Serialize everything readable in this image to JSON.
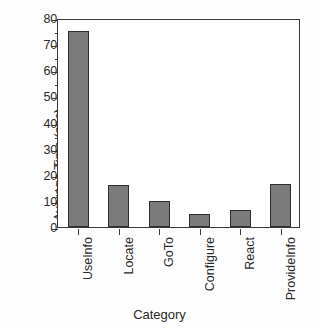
{
  "chart_data": {
    "type": "bar",
    "title": "",
    "xlabel": "Category",
    "ylabel": "Average Time (sec)",
    "categories": [
      "UseInfo",
      "Locate",
      "GoTo",
      "Configure",
      "React",
      "ProvideInfo"
    ],
    "values": [
      75,
      16,
      10,
      5,
      6.5,
      16.5
    ],
    "ylim": [
      0,
      80
    ],
    "yticks": [
      0,
      10,
      20,
      30,
      40,
      50,
      60,
      70,
      80
    ],
    "ytick_labels": [
      "0",
      "10",
      "20",
      "30",
      "40",
      "50",
      "60",
      "70",
      "80"
    ],
    "yminor_ticks": [
      5,
      15,
      25,
      35,
      45,
      55,
      65,
      75
    ],
    "grid": false,
    "legend": "none",
    "bar_color": "#7b7b7b",
    "bar_edge_color": "#2e2e2e",
    "axis_color": "#3a3a3a",
    "background_color": "#ffffff"
  }
}
